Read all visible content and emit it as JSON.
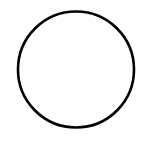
{
  "canvas": {
    "width": 152,
    "height": 142,
    "background": "#ffffff"
  },
  "shapes": [
    {
      "type": "circle",
      "cx": 76,
      "cy": 69.5,
      "r": 58,
      "stroke": "#000000",
      "stroke_width": 2.6,
      "fill": "none"
    }
  ]
}
